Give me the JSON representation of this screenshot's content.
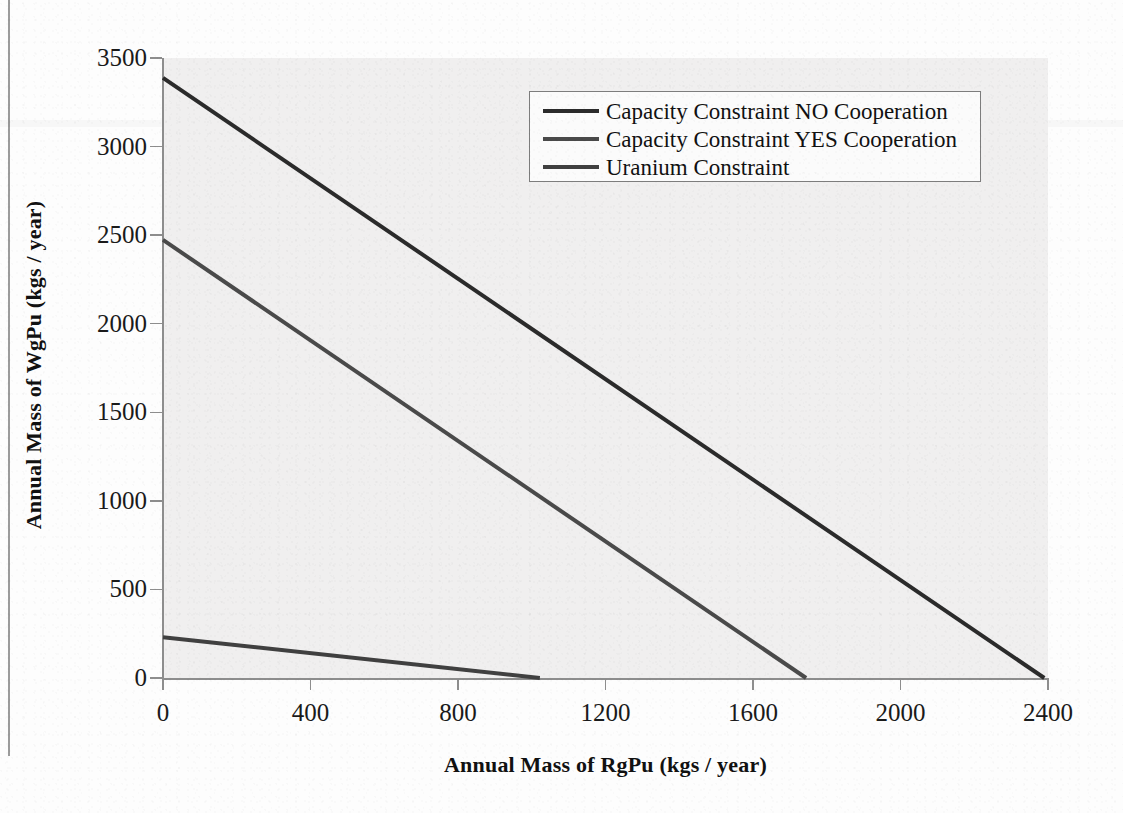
{
  "chart_data": {
    "type": "line",
    "title": "",
    "xlabel": "Annual Mass of RgPu (kgs / year)",
    "ylabel": "Annual Mass of WgPu (kgs / year)",
    "xlim": [
      0,
      2400
    ],
    "ylim": [
      0,
      3500
    ],
    "xticks": [
      0,
      400,
      800,
      1200,
      1600,
      2000,
      2400
    ],
    "yticks": [
      0,
      500,
      1000,
      1500,
      2000,
      2500,
      3000,
      3500
    ],
    "xtick_labels": [
      "0",
      "400",
      "800",
      "1200",
      "1600",
      "2000",
      "2400"
    ],
    "ytick_labels": [
      "0",
      "500",
      "1000",
      "1500",
      "2000",
      "2500",
      "3000",
      "3500"
    ],
    "grid": false,
    "legend_position": "top-right-inside",
    "plot_background": "#f0efef",
    "series": [
      {
        "name": "Capacity Constraint NO Cooperation",
        "color": "#2b2b2b",
        "linewidth": 4,
        "x": [
          0,
          2390
        ],
        "y": [
          3388,
          0
        ]
      },
      {
        "name": "Capacity Constraint YES Cooperation",
        "color": "#4a4a4a",
        "linewidth": 4,
        "x": [
          0,
          1744
        ],
        "y": [
          2473,
          0
        ]
      },
      {
        "name": "Uranium Constraint",
        "color": "#404040",
        "linewidth": 4,
        "x": [
          0,
          1022
        ],
        "y": [
          230,
          0
        ]
      }
    ]
  },
  "legend": {
    "entries": [
      {
        "label": "Capacity Constraint NO Cooperation",
        "color": "#2b2b2b"
      },
      {
        "label": "Capacity Constraint YES Cooperation",
        "color": "#4a4a4a"
      },
      {
        "label": "Uranium Constraint",
        "color": "#404040"
      }
    ]
  }
}
